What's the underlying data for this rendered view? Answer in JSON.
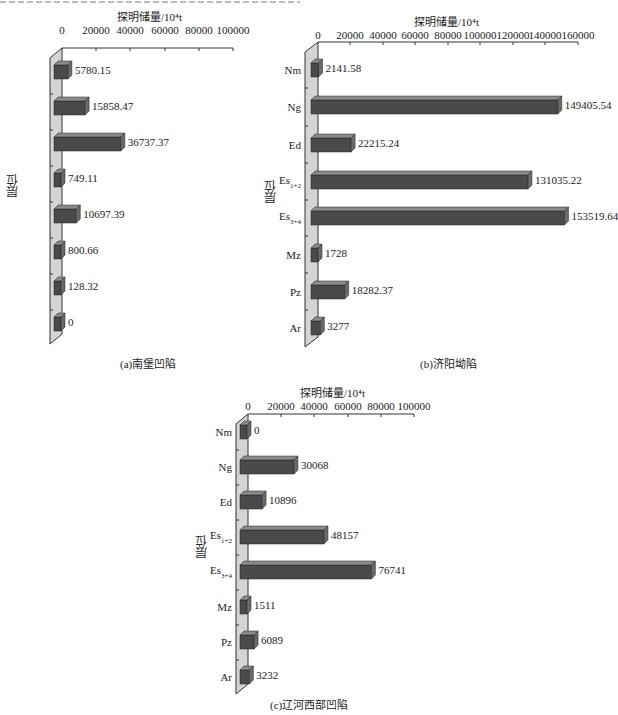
{
  "chart_data": [
    {
      "type": "bar",
      "orientation": "horizontal",
      "style": "3d",
      "title": "(a)南堡凹陷",
      "xlabel": "探明储量/10⁴t",
      "ylabel": "层位",
      "categories": [
        "Nm",
        "Ng",
        "Ed",
        "Es1+2",
        "Es3+4",
        "Mz",
        "Pz",
        "Ar"
      ],
      "values": [
        5780.15,
        15858.47,
        36737.37,
        749.11,
        10697.39,
        800.66,
        128.32,
        0
      ],
      "value_labels": [
        "5780.15",
        "15858.47",
        "36737.37",
        "749.11",
        "10697.39",
        "800.66",
        "128.32",
        "0"
      ],
      "xlim": [
        0,
        100000
      ],
      "xticks": [
        0,
        20000,
        40000,
        60000,
        80000,
        100000
      ],
      "xtick_labels": [
        "0",
        "20000",
        "40000",
        "60000",
        "80000",
        "100000"
      ],
      "grid": false,
      "legend": null
    },
    {
      "type": "bar",
      "orientation": "horizontal",
      "style": "3d",
      "title": "(b)济阳坳陷",
      "xlabel": "探明储量/10⁴t",
      "ylabel": "层位",
      "categories": [
        "Nm",
        "Ng",
        "Ed",
        "Es1+2",
        "Es3+4",
        "Mz",
        "Pz",
        "Ar"
      ],
      "values": [
        2141.58,
        149405.54,
        22215.24,
        131035.22,
        153519.64,
        1728,
        18282.37,
        3277
      ],
      "value_labels": [
        "2141.58",
        "149405.54",
        "22215.24",
        "131035.22",
        "153519.64",
        "1728",
        "18282.37",
        "3277"
      ],
      "xlim": [
        0,
        160000
      ],
      "xticks": [
        0,
        20000,
        40000,
        60000,
        80000,
        100000,
        120000,
        140000,
        160000
      ],
      "xtick_labels": [
        "0",
        "20000",
        "40000",
        "60000",
        "80000",
        "100000",
        "120000",
        "140000",
        "160000"
      ],
      "grid": false,
      "legend": null
    },
    {
      "type": "bar",
      "orientation": "horizontal",
      "style": "3d",
      "title": "(c)辽河西部凹陷",
      "xlabel": "探明储量/10⁴t",
      "ylabel": "层位",
      "categories": [
        "Nm",
        "Ng",
        "Ed",
        "Es1+2",
        "Es3+4",
        "Mz",
        "Pz",
        "Ar"
      ],
      "values": [
        0,
        30068,
        10896,
        48157,
        76741,
        1511,
        6089,
        3232
      ],
      "value_labels": [
        "0",
        "30068",
        "10896",
        "48157",
        "76741",
        "1511",
        "6089",
        "3232"
      ],
      "xlim": [
        0,
        100000
      ],
      "xticks": [
        0,
        20000,
        40000,
        60000,
        80000,
        100000
      ],
      "xtick_labels": [
        "0",
        "20000",
        "40000",
        "60000",
        "80000",
        "100000"
      ],
      "grid": false,
      "legend": null
    }
  ],
  "colors": {
    "bar_front": "#4a4a4a",
    "bar_top": "#8a8a8a",
    "bar_side": "#6a6a6a",
    "wall": "#d4d4d4",
    "axis": "#333333"
  },
  "charts": [
    {
      "axis_title": "探明储量/10⁴t",
      "ylabel": "层位",
      "caption": "(a)南堡凹陷",
      "ticks": [
        "0",
        "20000",
        "40000",
        "60000",
        "80000",
        "100000"
      ],
      "cats": [
        {
          "main": "Nm",
          "sub": ""
        },
        {
          "main": "Ng",
          "sub": ""
        },
        {
          "main": "Ed",
          "sub": ""
        },
        {
          "main": "Es",
          "sub": "1+2"
        },
        {
          "main": "Es",
          "sub": "3+4"
        },
        {
          "main": "Mz",
          "sub": ""
        },
        {
          "main": "Pz",
          "sub": ""
        },
        {
          "main": "Ar",
          "sub": ""
        }
      ],
      "vals": [
        "5780.15",
        "15858.47",
        "36737.37",
        "749.11",
        "10697.39",
        "800.66",
        "128.32",
        "0"
      ]
    },
    {
      "axis_title": "探明储量/10⁴t",
      "ylabel": "层位",
      "caption": "(b)济阳坳陷",
      "ticks": [
        "0",
        "20000",
        "40000",
        "60000",
        "80000",
        "100000",
        "120000",
        "140000",
        "160000"
      ],
      "cats": [
        {
          "main": "Nm",
          "sub": ""
        },
        {
          "main": "Ng",
          "sub": ""
        },
        {
          "main": "Ed",
          "sub": ""
        },
        {
          "main": "Es",
          "sub": "1+2"
        },
        {
          "main": "Es",
          "sub": "3+4"
        },
        {
          "main": "Mz",
          "sub": ""
        },
        {
          "main": "Pz",
          "sub": ""
        },
        {
          "main": "Ar",
          "sub": ""
        }
      ],
      "vals": [
        "2141.58",
        "149405.54",
        "22215.24",
        "131035.22",
        "153519.64",
        "1728",
        "18282.37",
        "3277"
      ]
    },
    {
      "axis_title": "探明储量/10⁴t",
      "ylabel": "层位",
      "caption": "(c)辽河西部凹陷",
      "ticks": [
        "0",
        "20000",
        "40000",
        "60000",
        "80000",
        "100000"
      ],
      "cats": [
        {
          "main": "Nm",
          "sub": ""
        },
        {
          "main": "Ng",
          "sub": ""
        },
        {
          "main": "Ed",
          "sub": ""
        },
        {
          "main": "Es",
          "sub": "1+2"
        },
        {
          "main": "Es",
          "sub": "3+4"
        },
        {
          "main": "Mz",
          "sub": ""
        },
        {
          "main": "Pz",
          "sub": ""
        },
        {
          "main": "Ar",
          "sub": ""
        }
      ],
      "vals": [
        "0",
        "30068",
        "10896",
        "48157",
        "76741",
        "1511",
        "6089",
        "3232"
      ]
    }
  ]
}
